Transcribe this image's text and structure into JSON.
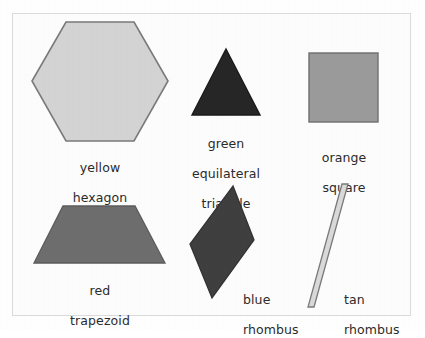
{
  "figure": {
    "background_color": "#ffffff",
    "paper_color": "#fdfdfd",
    "frame_border_color": "#dcdcdc",
    "text_color": "#2b2b2b",
    "outline_color": "#6f6f6f"
  },
  "shapes": [
    {
      "id": "yellow-hexagon",
      "name": "hexagon",
      "color_word": "yellow",
      "label": "yellow\nhexagon",
      "label_line1": "yellow",
      "label_line2": "hexagon",
      "fill": "#d4d4d4",
      "stroke": "#7a7a7a",
      "label_align": "center"
    },
    {
      "id": "green-equilateral-triangle",
      "name": "equilateral triangle",
      "color_word": "green",
      "label": "green\nequilateral\ntriangle",
      "label_line1": "green",
      "label_line2": "equilateral",
      "label_line3": "triangle",
      "fill": "#262626",
      "stroke": "#1a1a1a",
      "label_align": "center"
    },
    {
      "id": "orange-square",
      "name": "square",
      "color_word": "orange",
      "label": "orange\nsquare",
      "label_line1": "orange",
      "label_line2": "square",
      "fill": "#9b9b9b",
      "stroke": "#6f6f6f",
      "label_align": "center"
    },
    {
      "id": "red-trapezoid",
      "name": "trapezoid",
      "color_word": "red",
      "label": "red\ntrapezoid",
      "label_line1": "red",
      "label_line2": "trapezoid",
      "fill": "#6e6e6e",
      "stroke": "#5c5c5c",
      "label_align": "center"
    },
    {
      "id": "blue-rhombus",
      "name": "rhombus",
      "color_word": "blue",
      "label": "blue\nrhombus",
      "label_line1": "blue",
      "label_line2": "rhombus",
      "fill": "#3f3f3f",
      "stroke": "#333333",
      "label_align": "left"
    },
    {
      "id": "tan-rhombus",
      "name": "rhombus",
      "color_word": "tan",
      "label": "tan\nrhombus",
      "label_line1": "tan",
      "label_line2": "rhombus",
      "fill": "#dadada",
      "stroke": "#7a7a7a",
      "label_align": "left"
    }
  ]
}
